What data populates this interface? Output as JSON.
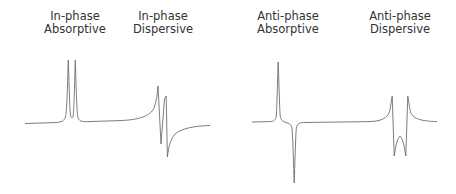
{
  "labels": [
    {
      "line1": "In-phase",
      "line2": "Absorptive",
      "cx": 75,
      "top": 10
    },
    {
      "line1": "In-phase",
      "line2": "Dispersive",
      "cx": 163,
      "top": 10
    },
    {
      "line1": "Anti-phase",
      "line2": "Absorptive",
      "cx": 288,
      "top": 10
    },
    {
      "line1": "Anti-phase",
      "line2": "Dispersive",
      "cx": 400,
      "top": 10
    }
  ],
  "colors": {
    "trace": "#6e6e6e",
    "text": "#333333",
    "background": "#ffffff"
  },
  "spectra": [
    {
      "name": "in-phase-spectrum",
      "baseline_y": 123,
      "x_start": 25,
      "x_end": 210
    },
    {
      "name": "anti-phase-spectrum",
      "baseline_y": 122,
      "x_start": 252,
      "x_end": 437
    }
  ]
}
